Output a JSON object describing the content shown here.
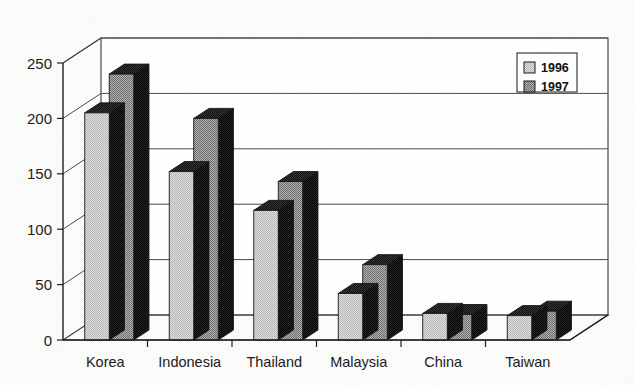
{
  "chart_data": {
    "type": "bar",
    "title": "",
    "subtitle": "",
    "xlabel": "",
    "ylabel": "",
    "categories": [
      "Korea",
      "Indonesia",
      "Thailand",
      "Malaysia",
      "China",
      "Taiwan"
    ],
    "series": [
      {
        "name": "1996",
        "values": [
          205,
          152,
          117,
          42,
          24,
          22
        ]
      },
      {
        "name": "1997",
        "values": [
          240,
          200,
          143,
          68,
          23,
          26
        ]
      }
    ],
    "ylim": [
      0,
      250
    ],
    "yticks": [
      0,
      50,
      100,
      150,
      200,
      250
    ],
    "ytick_labels": [
      "0",
      "50",
      "100",
      "150",
      "200",
      "250"
    ],
    "grid": true,
    "grid_axis": "y",
    "legend_position": "top-right",
    "style": "3d-bar",
    "annotations": []
  },
  "legend": {
    "entries": [
      {
        "label": "1996",
        "swatch": "light-gray-dither",
        "color": "#d4d4d4"
      },
      {
        "label": "1997",
        "swatch": "medium-gray-dither",
        "color": "#9a9a9a"
      }
    ]
  },
  "colors": {
    "series_1996_face": "#d2d2d2",
    "series_1997_face": "#979797",
    "bar_side": "#1e1e1e",
    "bar_top": "#2b2b2b",
    "axis": "#1f1f1f",
    "grid": "#4a4a4a",
    "background": "#fbfbfa",
    "text": "#1a1a1a"
  }
}
